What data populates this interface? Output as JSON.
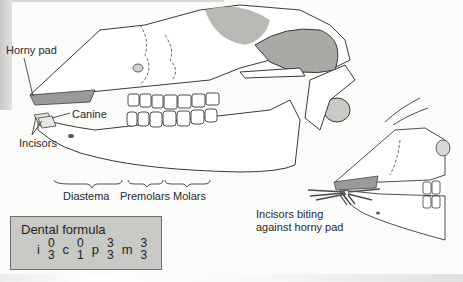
{
  "figure": {
    "labels": {
      "horny_pad": "Horny pad",
      "canine": "Canine",
      "incisors": "Incisors",
      "diastema": "Diastema",
      "premolars": "Premolars",
      "molars": "Molars",
      "inset_caption_line1": "Incisors biting",
      "inset_caption_line2": "against horny pad"
    },
    "dental_formula": {
      "title": "Dental formula",
      "teeth": [
        {
          "type": "i",
          "upper": "0",
          "lower": "3"
        },
        {
          "type": "c",
          "upper": "0",
          "lower": "1"
        },
        {
          "type": "p",
          "upper": "3",
          "lower": "3"
        },
        {
          "type": "m",
          "upper": "3",
          "lower": "3"
        }
      ]
    },
    "colors": {
      "line": "#3a3a3a",
      "horny_pad_fill": "#9a9a98",
      "shade_dark": "#8a8a88",
      "shade_mid": "#b8b8b5",
      "box_fill": "#c9c9c5"
    }
  }
}
